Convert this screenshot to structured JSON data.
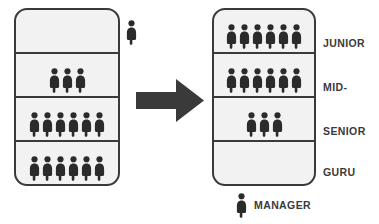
{
  "diagram": {
    "icon_name": "person-icon",
    "arrow_icon_name": "right-arrow-icon",
    "colors": {
      "figure": "#2b2b2b",
      "box_fill": "#f2f2f2",
      "box_border": "#3a3a3a",
      "arrow": "#3a3a3a",
      "label_text": "#3a3a3a"
    },
    "before": {
      "name": "before-pyramid",
      "tiers": [
        {
          "label": "",
          "count": 0
        },
        {
          "label": "",
          "count": 3
        },
        {
          "label": "",
          "count": 6
        },
        {
          "label": "",
          "count": 6
        }
      ],
      "standalone_figure_count": 1
    },
    "after": {
      "name": "after-pyramid",
      "tiers": [
        {
          "label": "JUNIOR",
          "count": 6
        },
        {
          "label": "MID-",
          "count": 6
        },
        {
          "label": "SENIOR",
          "count": 3
        },
        {
          "label": "GURU",
          "count": 0
        }
      ]
    },
    "legend": {
      "label": "MANAGER",
      "count": 1
    }
  },
  "chart_data": {
    "type": "bar",
    "categories": [
      "JUNIOR",
      "MID-",
      "SENIOR",
      "GURU"
    ],
    "series": [
      {
        "name": "Before",
        "values": [
          0,
          3,
          6,
          6
        ]
      },
      {
        "name": "After",
        "values": [
          6,
          6,
          3,
          0
        ]
      }
    ],
    "xlabel": "",
    "ylabel": "People",
    "ylim": [
      0,
      6
    ],
    "legend": [
      "MANAGER"
    ],
    "annotations": [
      "MANAGER"
    ]
  }
}
